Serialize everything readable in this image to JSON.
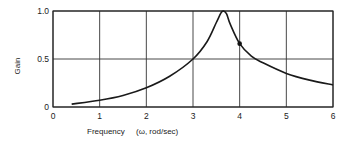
{
  "chart_data": {
    "type": "line",
    "title": "",
    "xlabel": "Frequency",
    "xlabel_units": "(ω, rod/sec)",
    "ylabel": "Gain",
    "xlim": [
      0,
      6
    ],
    "ylim": [
      0,
      1.0
    ],
    "x_ticks": [
      "0",
      "1",
      "2",
      "3",
      "4",
      "5",
      "6"
    ],
    "y_ticks": [
      "0",
      "0.5",
      "1.0"
    ],
    "grid": true,
    "legend": null,
    "series": [
      {
        "name": "Gain",
        "x": [
          0.4,
          1.0,
          1.5,
          2.0,
          2.5,
          3.0,
          3.3,
          3.5,
          3.6,
          3.65,
          3.72,
          3.8,
          4.0,
          4.25,
          4.5,
          5.0,
          5.5,
          6.0
        ],
        "y": [
          0.03,
          0.07,
          0.12,
          0.2,
          0.32,
          0.5,
          0.68,
          0.88,
          0.98,
          1.0,
          0.97,
          0.86,
          0.66,
          0.53,
          0.46,
          0.35,
          0.28,
          0.23
        ]
      }
    ],
    "annotations": [
      {
        "type": "marker",
        "x": 4.0,
        "y": 0.66,
        "shape": "filled-circle"
      }
    ]
  }
}
